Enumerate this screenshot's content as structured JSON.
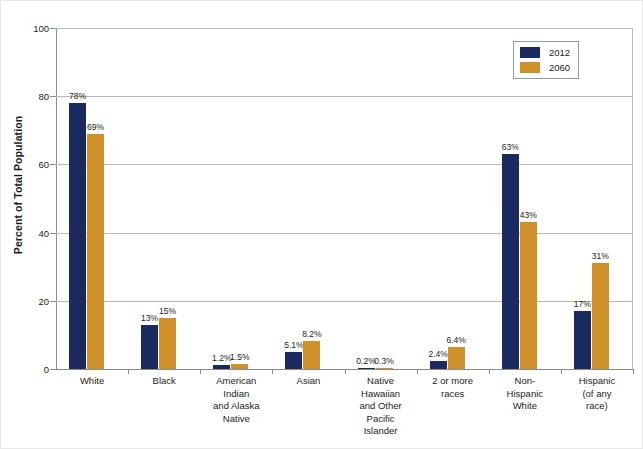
{
  "chart_data": {
    "type": "bar",
    "title": "",
    "xlabel": "",
    "ylabel": "Percent of Total Population",
    "ylim": [
      0,
      100
    ],
    "yticks": [
      0,
      20,
      40,
      60,
      80,
      100
    ],
    "ytick_labels": [
      "0",
      "20",
      "40",
      "60",
      "80",
      "100"
    ],
    "grid": true,
    "legend_position": "top-right",
    "categories": [
      "White",
      "Black",
      "American Indian and Alaska Native",
      "Asian",
      "Native Hawaiian and Other Pacific Islander",
      "2 or more races",
      "Non-Hispanic White",
      "Hispanic (of any race)"
    ],
    "category_label_lines": [
      [
        "White"
      ],
      [
        "Black"
      ],
      [
        "American",
        "Indian",
        "and Alaska",
        "Native"
      ],
      [
        "Asian"
      ],
      [
        "Native",
        "Hawaiian",
        "and Other",
        "Pacific",
        "Islander"
      ],
      [
        "2 or more",
        "races"
      ],
      [
        "Non-",
        "Hispanic",
        "White"
      ],
      [
        "Hispanic",
        "(of any",
        "race)"
      ]
    ],
    "series": [
      {
        "name": "2012",
        "color": "#1b2a5e",
        "values": [
          78,
          13,
          1.2,
          5.1,
          0.2,
          2.4,
          63,
          17
        ],
        "data_labels": [
          "78%",
          "13%",
          "1.2%",
          "5.1%",
          "0.2%",
          "2.4%",
          "63%",
          "17%"
        ]
      },
      {
        "name": "2060",
        "color": "#d1912a",
        "values": [
          69,
          15,
          1.5,
          8.2,
          0.3,
          6.4,
          43,
          31
        ],
        "data_labels": [
          "69%",
          "15%",
          "1.5%",
          "8.2%",
          "0.3%",
          "6.4%",
          "43%",
          "31%"
        ]
      }
    ]
  },
  "legend": {
    "items": [
      {
        "label": "2012",
        "color": "#1b2a5e"
      },
      {
        "label": "2060",
        "color": "#d1912a"
      }
    ]
  },
  "colors": {
    "series_2012": "#1b2a5e",
    "series_2060": "#d1912a",
    "gridline": "#b9b9b9",
    "axis": "#8a8a8a",
    "text": "#1b1b1b",
    "background": "#ffffff"
  }
}
